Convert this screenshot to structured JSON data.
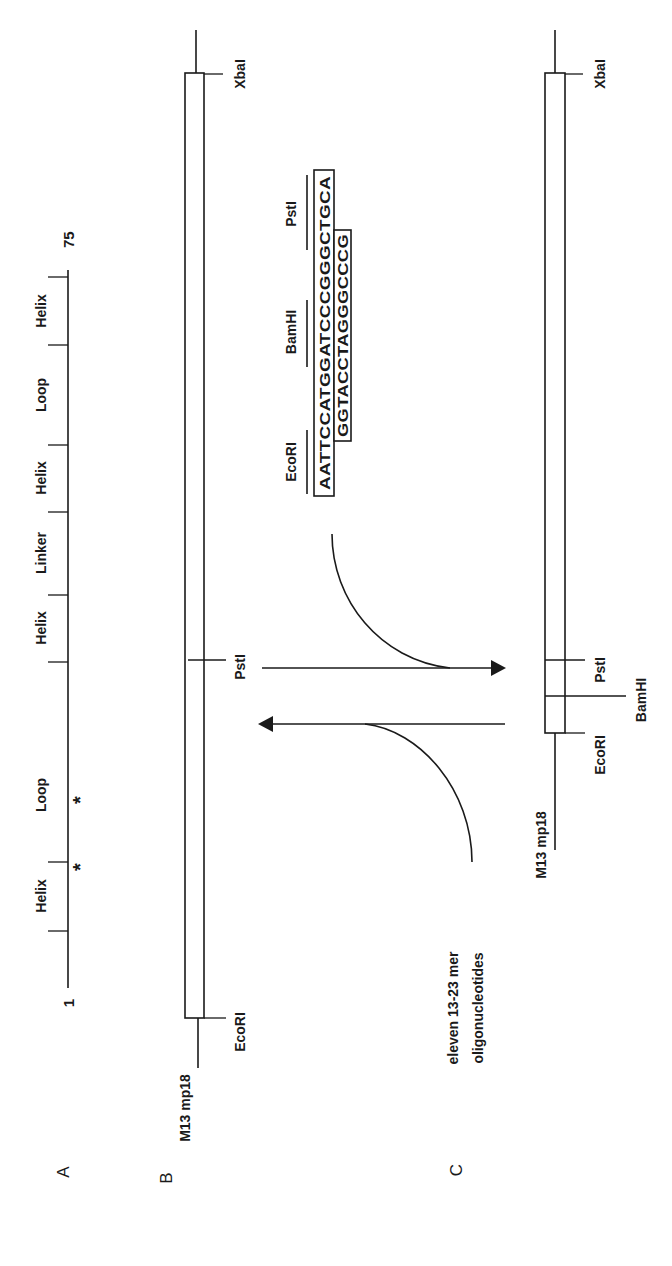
{
  "figure": {
    "orientation": "rotated-90-ccw",
    "panels": {
      "A": {
        "label": "A",
        "start_label": "1",
        "end_label": "75",
        "segments": [
          "Helix",
          "Loop",
          "Helix",
          "Linker",
          "Helix",
          "Loop",
          "Helix"
        ],
        "markers": [
          "*",
          "*"
        ]
      },
      "B": {
        "label": "B",
        "vector_label": "M13 mp18",
        "sites": [
          "EcoRI",
          "PstI",
          "XbaI"
        ]
      },
      "C": {
        "label": "C",
        "vector_label": "M13 mp18",
        "sites": [
          "EcoRI",
          "BamHI",
          "PstI",
          "XbaI"
        ]
      }
    },
    "insert": {
      "site_labels": [
        "EcoRI",
        "BamHI",
        "PstI"
      ],
      "top_strand": "AATTCCATGGATCCCGGGCTGCA",
      "bottom_strand": "GGTACCTAGGGCCCG"
    },
    "annotation": {
      "line1": "eleven 13-23 mer",
      "line2": "oligonucleotides"
    }
  }
}
